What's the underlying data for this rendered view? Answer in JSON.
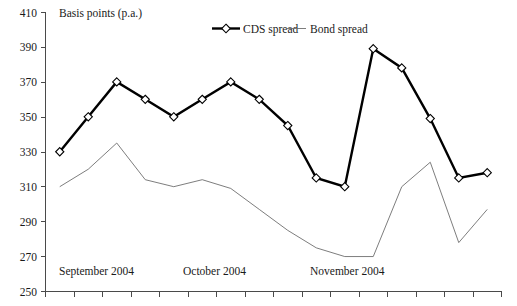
{
  "chart_data": {
    "type": "line",
    "title": "",
    "ylabel": "Basis points (p.a.)",
    "xlabel": "",
    "ylim": [
      250,
      410
    ],
    "ytick_step": 20,
    "yticks": [
      "410",
      "390",
      "370",
      "350",
      "330",
      "310",
      "290",
      "270",
      "250"
    ],
    "grid": false,
    "legend_position": "top-center",
    "x": [
      1,
      2,
      3,
      4,
      5,
      6,
      7,
      8,
      9,
      10,
      11,
      12,
      13,
      14,
      15,
      16
    ],
    "xtick_count": 17,
    "x_group_labels": [
      "September 2004",
      "October 2004",
      "November 2004"
    ],
    "series": [
      {
        "name": "CDS spread",
        "marker": "diamond",
        "color": "#000000",
        "line_width": "thick",
        "values": [
          330,
          350,
          370,
          360,
          350,
          360,
          370,
          360,
          345,
          315,
          310,
          389,
          378,
          349,
          315,
          318
        ]
      },
      {
        "name": "Bond spread",
        "marker": "none",
        "color": "#6e6e6e",
        "line_width": "thin",
        "values": [
          310,
          320,
          335,
          314,
          310,
          314,
          309,
          297,
          285,
          275,
          270,
          270,
          310,
          324,
          278,
          297
        ]
      }
    ]
  },
  "axis": {
    "y_title": "Basis points (p.a.)",
    "y_tick_410": "410",
    "y_tick_390": "390",
    "y_tick_370": "370",
    "y_tick_350": "350",
    "y_tick_330": "330",
    "y_tick_310": "310",
    "y_tick_290": "290",
    "y_tick_270": "270",
    "y_tick_250": "250"
  },
  "x_axis": {
    "month_1": "September 2004",
    "month_2": "October 2004",
    "month_3": "November 2004"
  },
  "legend": {
    "item_1": "CDS spread",
    "item_2": "Bond spread"
  }
}
